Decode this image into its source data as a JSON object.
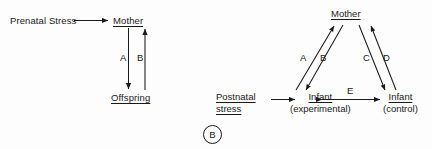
{
  "figure": {
    "background_color": "#fdfdfd",
    "ink_color": "#1a1a1a",
    "panel_tag": "B",
    "panels": [
      {
        "id": "prenatal",
        "nodes": [
          {
            "name": "prenatal-stress",
            "text": "Prenatal Stress",
            "underlined": false
          },
          {
            "name": "mother",
            "text": "Mother",
            "underlined": true
          },
          {
            "name": "offspring",
            "text": "Offspring",
            "underlined": true
          }
        ],
        "edges": [
          {
            "name": "prenatal-to-mother",
            "label": "",
            "from": "Prenatal Stress",
            "to": "Mother",
            "direction": "forward"
          },
          {
            "name": "edge-a",
            "label": "A",
            "from": "Mother",
            "to": "Offspring",
            "direction": "down"
          },
          {
            "name": "edge-b",
            "label": "B",
            "from": "Offspring",
            "to": "Mother",
            "direction": "up"
          }
        ]
      },
      {
        "id": "postnatal",
        "nodes": [
          {
            "name": "postnatal-stress",
            "line1": "Postnatal",
            "line2": "stress",
            "underlined": true
          },
          {
            "name": "mother",
            "text": "Mother",
            "underlined": true
          },
          {
            "name": "infant-experimental",
            "line1": "Infant",
            "line2": "(experimental)",
            "underlined": false
          },
          {
            "name": "infant-control",
            "line1": "Infant",
            "line2": "(control)",
            "underlined": false
          }
        ],
        "edges": [
          {
            "name": "postnatal-to-infant",
            "label": "",
            "from": "Postnatal stress",
            "to": "Infant (experimental)",
            "direction": "forward"
          },
          {
            "name": "edge-a",
            "label": "A",
            "from": "Infant (experimental)",
            "to": "Mother",
            "direction": "up"
          },
          {
            "name": "edge-b",
            "label": "B",
            "from": "Mother",
            "to": "Infant (experimental)",
            "direction": "down"
          },
          {
            "name": "edge-c",
            "label": "C",
            "from": "Mother",
            "to": "Infant (control)",
            "direction": "down"
          },
          {
            "name": "edge-d",
            "label": "D",
            "from": "Infant (control)",
            "to": "Mother",
            "direction": "up"
          },
          {
            "name": "edge-e",
            "label": "E",
            "from": "Infant (experimental)",
            "to": "Infant (control)",
            "direction": "both"
          }
        ]
      }
    ]
  }
}
